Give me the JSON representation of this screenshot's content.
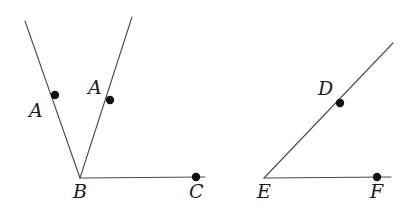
{
  "figure": {
    "type": "geometry-diagram",
    "title": "",
    "background_color": "#ffffff",
    "line_color": "#4a4a4a",
    "point_color": "#111111",
    "label_color": "#1a1a1a",
    "stroke_width": 1.1,
    "point_radius": 4.2,
    "shapes": [
      {
        "name": "left-angle",
        "vertex": "B",
        "rays": [
          {
            "name": "ray-b-to-a-left",
            "from": [
              80,
              178
            ],
            "to": [
              25,
              21
            ]
          },
          {
            "name": "ray-b-to-a-right",
            "from": [
              80,
              178
            ],
            "to": [
              132,
              17
            ]
          },
          {
            "name": "ray-b-to-c",
            "from": [
              80,
              178
            ],
            "to": [
              205,
              177
            ]
          }
        ]
      },
      {
        "name": "right-angle",
        "vertex": "E",
        "rays": [
          {
            "name": "ray-e-to-d",
            "from": [
              264,
              178
            ],
            "to": [
              393,
              43
            ]
          },
          {
            "name": "ray-e-to-f",
            "from": [
              264,
              178
            ],
            "to": [
              391,
              177
            ]
          }
        ]
      }
    ],
    "points": [
      {
        "name": "point-a-left",
        "label": "A",
        "cx": 55,
        "cy": 95,
        "label_x": 29,
        "label_y": 101
      },
      {
        "name": "point-a-right",
        "label": "A",
        "cx": 110,
        "cy": 100,
        "label_x": 88,
        "label_y": 78
      },
      {
        "name": "point-b",
        "label": "B",
        "cx": null,
        "cy": null,
        "label_x": 73,
        "label_y": 182
      },
      {
        "name": "point-c",
        "label": "C",
        "cx": 196,
        "cy": 177,
        "label_x": 189,
        "label_y": 182
      },
      {
        "name": "point-d",
        "label": "D",
        "cx": 340,
        "cy": 103,
        "label_x": 318,
        "label_y": 79
      },
      {
        "name": "point-e",
        "label": "E",
        "cx": null,
        "cy": null,
        "label_x": 257,
        "label_y": 182
      },
      {
        "name": "point-f",
        "label": "F",
        "cx": 377,
        "cy": 177,
        "label_x": 370,
        "label_y": 182
      }
    ],
    "labels": {
      "a_left": "A",
      "a_right": "A",
      "b": "B",
      "c": "C",
      "d": "D",
      "e": "E",
      "f": "F"
    }
  }
}
